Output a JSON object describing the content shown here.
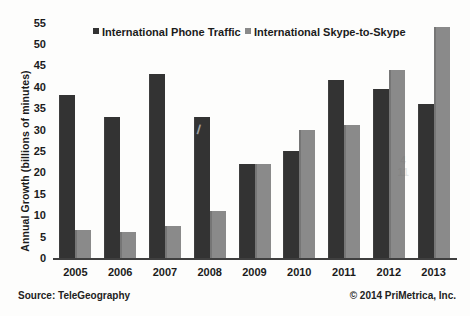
{
  "chart_data": {
    "type": "bar",
    "title": "",
    "xlabel": "",
    "ylabel": "Annual Growth (billions of minutes)",
    "categories": [
      "2005",
      "2006",
      "2007",
      "2008",
      "2009",
      "2010",
      "2011",
      "2012",
      "2013"
    ],
    "series": [
      {
        "name": "International Phone Traffic",
        "color": "#333333",
        "values": [
          38,
          33,
          43,
          33,
          22,
          25,
          41.5,
          39.5,
          36
        ]
      },
      {
        "name": "International Skype-to-Skype",
        "color": "#8a8a8a",
        "values": [
          6.5,
          6,
          7.5,
          11,
          22,
          30,
          31,
          44,
          54
        ]
      }
    ],
    "ylim": [
      0,
      55
    ],
    "yticks": [
      0,
      5,
      10,
      15,
      20,
      25,
      30,
      35,
      40,
      45,
      50,
      55
    ],
    "grid": false,
    "legend_position": "top"
  },
  "footer": {
    "source": "Source: TeleGeography",
    "copyright": "© 2014 PriMetrica, Inc."
  },
  "artifacts": {
    "mark_2008": "/",
    "mark_2012": "4\n11"
  }
}
